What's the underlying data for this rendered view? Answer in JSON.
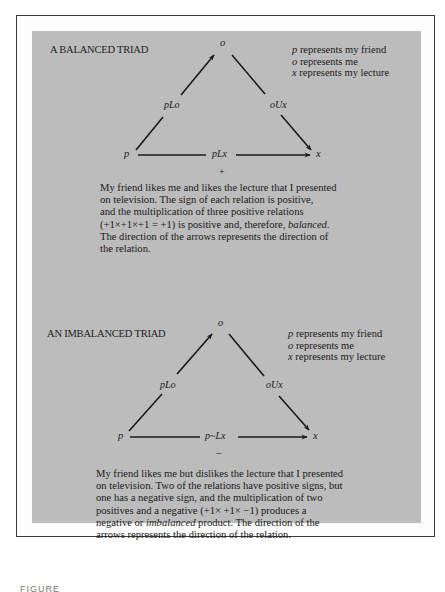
{
  "balanced": {
    "title": "A BALANCED TRIAD",
    "nodes": {
      "o": "o",
      "p": "p",
      "x": "x"
    },
    "relations": {
      "p_to_o": "pLo",
      "o_to_x": "oUx",
      "p_to_x": "pLx"
    },
    "product_sign": "+",
    "legend": [
      {
        "symbol": "p",
        "text": "represents my friend"
      },
      {
        "symbol": "o",
        "text": "represents me"
      },
      {
        "symbol": "x",
        "text": "represents my lecture"
      }
    ],
    "paragraph_lines": [
      "My friend likes me and likes the lecture that I presented",
      "on television. The sign of each relation is positive,",
      "and the multiplication of three positive relations",
      "(+1×+1×+1 = +1) is positive and, therefore, ",
      "The direction of the arrows represents the direction of",
      "the relation."
    ],
    "emphasis_word": "balanced."
  },
  "imbalanced": {
    "title": "AN IMBALANCED TRIAD",
    "nodes": {
      "o": "o",
      "p": "p",
      "x": "x"
    },
    "relations": {
      "p_to_o": "pLo",
      "o_to_x": "oUx",
      "p_to_x": "p~Lx"
    },
    "product_sign": "–",
    "legend": [
      {
        "symbol": "p",
        "text": "represents my friend"
      },
      {
        "symbol": "o",
        "text": "represents me"
      },
      {
        "symbol": "x",
        "text": "represents my lecture"
      }
    ],
    "paragraph_lines": [
      "My friend likes me but dislikes the lecture that I presented",
      "on television. Two of the relations have positive signs, but",
      "one has a negative sign, and the multiplication of two",
      "positives and a negative (+1× +1× −1) produces a",
      "negative or ",
      "arrows represents the direction of the relation."
    ],
    "emphasis_word": "imbalanced",
    "line5_tail": " product. The direction of the"
  },
  "caption": "FIGURE",
  "colors": {
    "panel": "#bcbcbc",
    "ink": "#1a1a1a",
    "frame": "#3a3a3a"
  }
}
